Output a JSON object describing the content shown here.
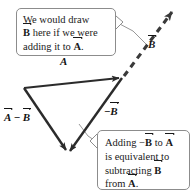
{
  "figure": {
    "background_color": "#ffffff",
    "stroke_color": "#2b2b2b",
    "callout_border_color": "#8c8c8c",
    "text_color": "#1a1a1a"
  },
  "callouts": [
    {
      "name": "adding-note",
      "lines": [
        {
          "pre": "We would draw",
          "vec": "",
          "post": ""
        },
        {
          "pre": "",
          "vec": "B",
          "post": " here if we were"
        },
        {
          "pre": "adding it to ",
          "vec": "A",
          "post": "."
        }
      ],
      "text": "We would draw B here if we were adding it to A."
    },
    {
      "name": "subtracting-note",
      "lines": [
        {
          "pre": "Adding −",
          "vec": "B",
          "post": " to "
        },
        {
          "pre": "is equivalent to",
          "vec": "",
          "post": ""
        },
        {
          "pre": "subtracting ",
          "vec": "B",
          "post": ""
        },
        {
          "pre": "from ",
          "vec": "A",
          "post": "."
        }
      ],
      "text": "Adding −B to A is equivalent to subtracting B from A."
    }
  ],
  "vector_labels": [
    {
      "name": "label-A",
      "prefix": "",
      "symbol": "A",
      "suffix": ""
    },
    {
      "name": "label-B",
      "prefix": "",
      "symbol": "B",
      "suffix": ""
    },
    {
      "name": "label-neg-B",
      "prefix": "−",
      "symbol": "B",
      "suffix": ""
    },
    {
      "name": "label-A-minus-B",
      "prefix": "",
      "symbol": "A",
      "suffix": ""
    }
  ],
  "labels": {
    "A": "A",
    "B": "B",
    "minus": "−",
    "period": "."
  },
  "geometry": {
    "triangle_left_vertex": [
      24,
      88
    ],
    "triangle_right_vertex": [
      122,
      78
    ],
    "triangle_bottom_vertex": [
      68,
      156
    ],
    "dashed_arrow_tip": [
      175,
      8
    ],
    "dashed_arrow_start": [
      122,
      78
    ]
  }
}
